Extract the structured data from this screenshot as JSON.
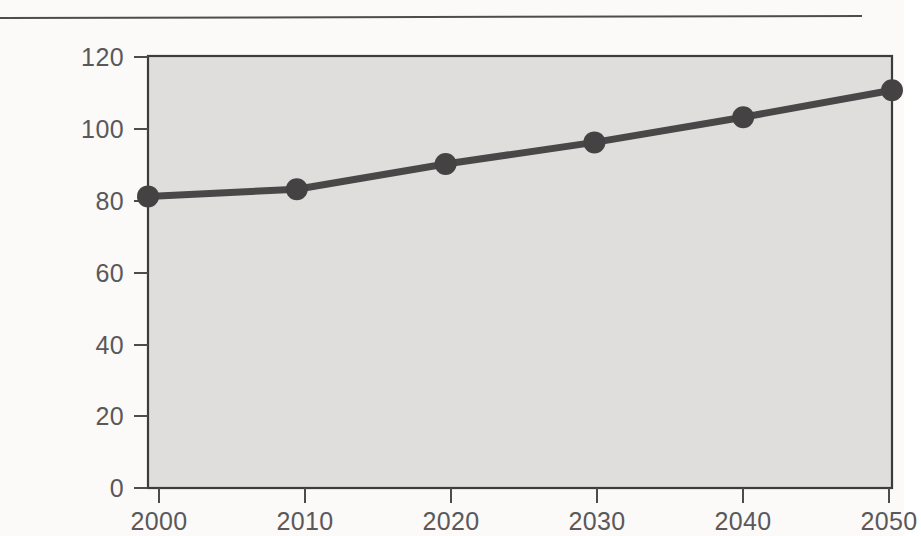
{
  "figure": {
    "background_color": "#fbfaf8",
    "rule_color": "#4d4d4d"
  },
  "chart_data": {
    "type": "line",
    "title": "",
    "subtitle": "",
    "xlabel": "",
    "ylabel": "",
    "x": [
      2000,
      2010,
      2020,
      2030,
      2040,
      2050
    ],
    "categories": [
      "2000",
      "2010",
      "2020",
      "2030",
      "2040",
      "2050"
    ],
    "values": [
      81,
      83,
      90,
      96,
      103,
      110.5
    ],
    "series": [
      {
        "name": "",
        "values": [
          81,
          83,
          90,
          96,
          103,
          110.5
        ]
      }
    ],
    "xlim": [
      2000,
      2050
    ],
    "ylim": [
      0,
      120
    ],
    "x_ticks": [
      2000,
      2010,
      2020,
      2030,
      2040,
      2050
    ],
    "x_tick_labels": [
      "2000",
      "2010",
      "2020",
      "2030",
      "2040",
      "2050"
    ],
    "y_ticks": [
      0,
      20,
      40,
      60,
      80,
      100,
      120
    ],
    "y_tick_labels": [
      "0",
      "20",
      "40",
      "60",
      "80",
      "100",
      "120"
    ],
    "grid": false,
    "legend": null,
    "legend_position": "none",
    "annotations": [],
    "line_color": "#4a4749",
    "marker_color": "#454244",
    "marker_shape": "circle",
    "plot_area_color": "#e0dedd",
    "plot_border_color": "#3d3b3c"
  },
  "y_axis": {
    "tick_labels": [
      "120",
      "100",
      "80",
      "60",
      "40",
      "20",
      "0"
    ]
  },
  "x_axis": {
    "tick_labels": [
      "2000",
      "2010",
      "2020",
      "2030",
      "2040",
      "2050"
    ]
  }
}
